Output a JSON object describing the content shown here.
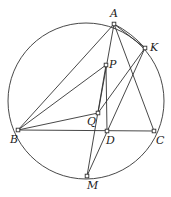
{
  "diagram": {
    "circle": {
      "cx": 86,
      "cy": 101,
      "r": 78
    },
    "points": {
      "A": {
        "x": 114,
        "y": 24,
        "label": "A",
        "lx": 110,
        "ly": 17
      },
      "K": {
        "x": 145,
        "y": 48,
        "label": "K",
        "lx": 150,
        "ly": 51
      },
      "P": {
        "x": 106,
        "y": 65,
        "label": "P",
        "lx": 109,
        "ly": 68
      },
      "Q": {
        "x": 98,
        "y": 113,
        "label": "Q",
        "lx": 87,
        "ly": 125
      },
      "B": {
        "x": 18,
        "y": 130,
        "label": "B",
        "lx": 10,
        "ly": 143
      },
      "D": {
        "x": 107,
        "y": 131,
        "label": "D",
        "lx": 106,
        "ly": 144
      },
      "C": {
        "x": 154,
        "y": 131,
        "label": "C",
        "lx": 156,
        "ly": 144
      },
      "M": {
        "x": 87,
        "y": 176,
        "label": "M",
        "lx": 87,
        "ly": 189
      }
    },
    "segments": [
      [
        "A",
        "B"
      ],
      [
        "A",
        "C"
      ],
      [
        "A",
        "Q"
      ],
      [
        "A",
        "K"
      ],
      [
        "B",
        "C"
      ],
      [
        "B",
        "P"
      ],
      [
        "B",
        "Q"
      ],
      [
        "P",
        "D"
      ],
      [
        "P",
        "M"
      ],
      [
        "K",
        "Q"
      ],
      [
        "K",
        "M"
      ]
    ]
  }
}
